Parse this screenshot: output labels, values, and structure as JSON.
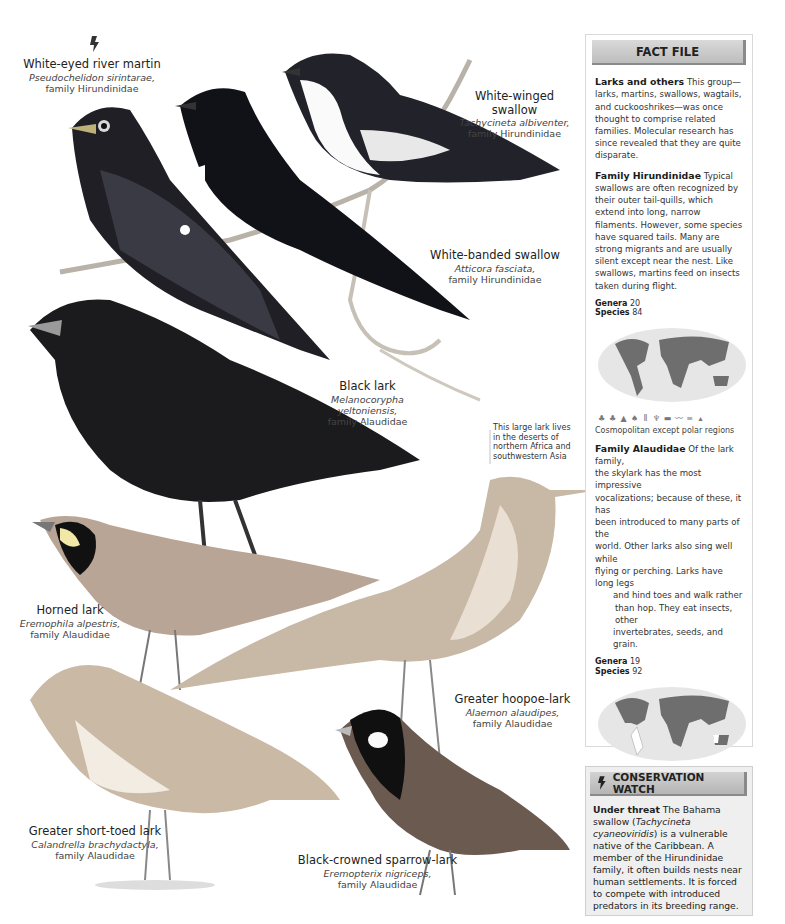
{
  "species": [
    {
      "name": "White-eyed river martin",
      "scientific": "Pseudochelidon sirintarae,",
      "family": "family Hirundinidae",
      "threatened": true
    },
    {
      "name": "White-winged swallow",
      "scientific": "Tachycineta albiventer,",
      "family": "family Hirundinidae"
    },
    {
      "name": "White-banded swallow",
      "scientific": "Atticora fasciata,",
      "family": "family Hirundinidae"
    },
    {
      "name": "Black lark",
      "scientific": "Melanocorypha yeltoniensis,",
      "family": "family Alaudidae"
    },
    {
      "name": "Horned lark",
      "scientific": "Eremophila alpestris,",
      "family": "family Alaudidae"
    },
    {
      "name": "Greater hoopoe-lark",
      "scientific": "Alaemon alaudipes,",
      "family": "family Alaudidae"
    },
    {
      "name": "Greater short-toed lark",
      "scientific": "Calandrella brachydactyla,",
      "family": "family Alaudidae"
    },
    {
      "name": "Black-crowned sparrow-lark",
      "scientific": "Eremopterix nigriceps,",
      "family": "family Alaudidae"
    }
  ],
  "notes": {
    "black_lark": [
      "This large lark lives",
      "in the deserts of",
      "northern Africa and",
      "southwestern Asia"
    ]
  },
  "fact_file": {
    "title": "FACT FILE",
    "intro": {
      "heading": "Larks and others",
      "text": "This group—larks, martins, swallows, wagtails, and cuckooshrikes—was once thought to comprise related families. Molecular research has since revealed that they are quite disparate."
    },
    "hirundinidae": {
      "heading": "Family Hirundinidae",
      "text": "Typical swallows are often recognized by their outer tail-quills, which extend into long, narrow filaments. However, some species have squared tails. Many are strong migrants and are usually silent except near the nest. Like swallows, martins feed on insects taken during flight.",
      "genera_label": "Genera",
      "genera": "20",
      "species_label": "Species",
      "species": "84",
      "habitat_icons": [
        "forest-icon",
        "woodland-icon",
        "conifer-icon",
        "shrub-icon",
        "grassland-icon",
        "wetland-icon",
        "urban-icon",
        "farmland-icon",
        "water-icon",
        "mountain-icon"
      ],
      "distribution": "Cosmopolitan except polar regions"
    },
    "alaudidae": {
      "heading": "Family Alaudidae",
      "lines": [
        "Of the lark family,",
        "the skylark has the most impressive",
        "vocalizations; because of these, it has",
        "been introduced to many parts of the",
        "world. Other larks also sing well while",
        "flying or perching. Larks have long legs",
        "and hind toes and walk rather",
        "than hop. They eat insects, other",
        "invertebrates, seeds, and grain."
      ],
      "genera_label": "Genera",
      "genera": "19",
      "species_label": "Species",
      "species": "92",
      "habitat_icons": [
        "forest-icon",
        "shrub-icon",
        "grassland-icon",
        "wetland-icon",
        "farmland-icon",
        "desert-icon"
      ],
      "distribution": "Cosmopolitan except C. & S. South America, S.W. Australia"
    },
    "courtship": {
      "heading": "Courtship",
      "text": "The courtship of the male horned lark (Eremophila alpestris) involves some complicated acrobatics."
    }
  },
  "conservation": {
    "title": "CONSERVATION WATCH",
    "heading": "Under threat",
    "text_a": "The Bahama swallow (",
    "italic": "Tachycineta cyaneoviridis",
    "text_b": ") is a vulnerable native of the Caribbean. A member of the Hirundinidae family, it often builds nests near human settlements. It is forced to compete with introduced predators in its breeding range."
  },
  "colors": {
    "header_gray": "#c8c8c8",
    "panel_bg": "#efefef",
    "map_land": "#6e6e6e",
    "map_sea": "#e6e6e6"
  }
}
